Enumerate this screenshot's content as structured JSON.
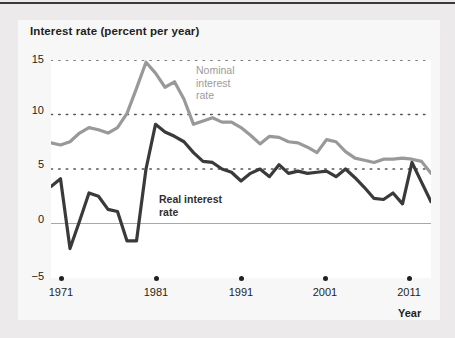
{
  "chart_data": {
    "type": "line",
    "title": "Interest rate (percent per year)",
    "xlabel": "Year",
    "ylabel": "Interest rate (percent per year)",
    "xlim": [
      1971,
      2011
    ],
    "ylim": [
      -5,
      15
    ],
    "grid": "horizontal-dotted",
    "legend_position": "inline-annotations",
    "x": [
      1971,
      1972,
      1973,
      1974,
      1975,
      1976,
      1977,
      1978,
      1979,
      1980,
      1981,
      1982,
      1983,
      1984,
      1985,
      1986,
      1987,
      1988,
      1989,
      1990,
      1991,
      1992,
      1993,
      1994,
      1995,
      1996,
      1997,
      1998,
      1999,
      2000,
      2001,
      2002,
      2003,
      2004,
      2005,
      2006,
      2007,
      2008,
      2009,
      2010,
      2011
    ],
    "series": [
      {
        "name": "Nominal interest rate",
        "color": "#999999",
        "values": [
          7.4,
          7.2,
          7.5,
          8.3,
          8.8,
          8.6,
          8.3,
          8.8,
          10.1,
          12.4,
          14.8,
          13.8,
          12.5,
          13.0,
          11.4,
          9.1,
          9.4,
          9.7,
          9.3,
          9.3,
          8.8,
          8.1,
          7.3,
          8.0,
          7.9,
          7.5,
          7.4,
          7.0,
          6.5,
          7.7,
          7.5,
          6.6,
          6.0,
          5.8,
          5.6,
          5.9,
          5.9,
          6.0,
          5.9,
          5.7,
          4.6
        ]
      },
      {
        "name": "Real interest rate",
        "color": "#3a3a3a",
        "values": [
          3.4,
          4.1,
          -2.3,
          0.2,
          2.8,
          2.5,
          1.3,
          1.1,
          -1.6,
          -1.6,
          5.0,
          9.1,
          8.4,
          8.0,
          7.5,
          6.5,
          5.7,
          5.6,
          5.0,
          4.7,
          3.9,
          4.6,
          5.0,
          4.3,
          5.4,
          4.6,
          4.8,
          4.6,
          4.7,
          4.8,
          4.3,
          5.0,
          4.2,
          3.3,
          2.3,
          2.2,
          2.8,
          1.8,
          5.6,
          3.8,
          2.0
        ]
      }
    ],
    "yticks": [
      15,
      10,
      5,
      0,
      -5
    ],
    "xticks": [
      1971,
      1981,
      1991,
      2001,
      2011
    ]
  },
  "axis": {
    "y_labels": [
      "15",
      "10",
      "5",
      "0",
      "−5"
    ],
    "x_labels": [
      "1971",
      "1981",
      "1991",
      "2001",
      "2011"
    ],
    "x_title": "Year"
  },
  "annotations": {
    "nominal": "Nominal\ninterest\nrate",
    "nominal_lines": [
      "Nominal",
      "interest",
      "rate"
    ],
    "real": "Real interest\nrate",
    "real_lines": [
      "Real interest",
      "rate"
    ]
  },
  "colors": {
    "nominal": "#999999",
    "real": "#3a3a3a",
    "grid": "#555555",
    "zero_line": "#a8a8a8",
    "page_background": "#eceaea",
    "card_background": "#f7f7f7",
    "plot_background": "#ffffff",
    "text": "#231f20"
  }
}
